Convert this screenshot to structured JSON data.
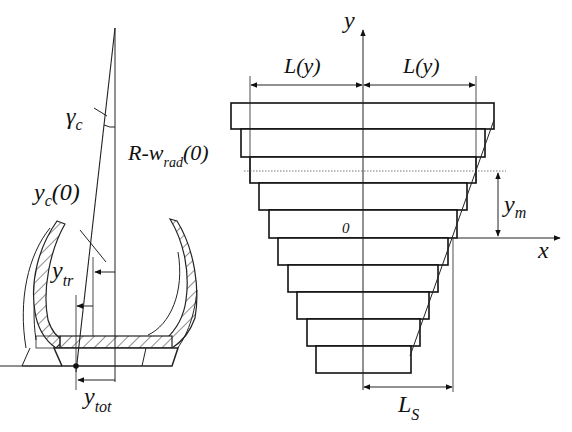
{
  "left_figure": {
    "title": "tire cross-section with contact geometry",
    "labels": {
      "gamma": {
        "main": "γ",
        "sub": "c"
      },
      "yc0": {
        "main": "y",
        "sub": "c",
        "suffix": "(0)"
      },
      "r_wrad": {
        "main": "R-w",
        "sub": "rad",
        "suffix": "(0)"
      },
      "ytr": {
        "main": "y",
        "sub": "tr"
      },
      "ytot": {
        "main": "y",
        "sub": "tot"
      }
    }
  },
  "right_figure": {
    "title": "stepped layer model of contact patch",
    "axis_labels": {
      "y": "y",
      "x": "x",
      "origin": "0"
    },
    "dimension_labels": {
      "L_left": "L(y)",
      "L_right": "L(y)",
      "ym": {
        "main": "y",
        "sub": "m"
      },
      "Ls": {
        "main": "L",
        "sub": "S"
      }
    },
    "layer_count": 10,
    "layers": [
      {
        "left": 231,
        "right": 494,
        "top": 103,
        "bottom": 129
      },
      {
        "left": 241,
        "right": 485,
        "top": 129,
        "bottom": 157
      },
      {
        "left": 250,
        "right": 476,
        "top": 157,
        "bottom": 183
      },
      {
        "left": 259,
        "right": 467,
        "top": 183,
        "bottom": 210
      },
      {
        "left": 269,
        "right": 457,
        "top": 210,
        "bottom": 238
      },
      {
        "left": 278,
        "right": 448,
        "top": 238,
        "bottom": 265
      },
      {
        "left": 288,
        "right": 438,
        "top": 265,
        "bottom": 292
      },
      {
        "left": 297,
        "right": 429,
        "top": 292,
        "bottom": 319
      },
      {
        "left": 307,
        "right": 420,
        "top": 319,
        "bottom": 346
      },
      {
        "left": 316,
        "right": 411,
        "top": 346,
        "bottom": 373
      }
    ]
  }
}
